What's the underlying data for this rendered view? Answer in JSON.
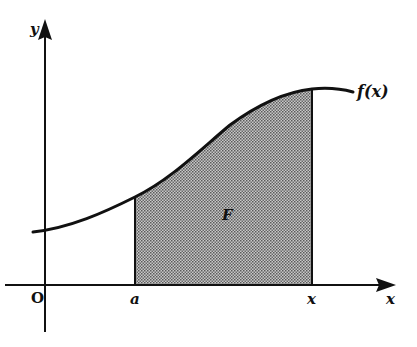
{
  "diagram": {
    "labels": {
      "y_axis": "y",
      "x_axis": "x",
      "origin": "O",
      "lower_bound": "a",
      "upper_bound": "x",
      "function": "f(x)",
      "area": "F"
    },
    "colors": {
      "line": "#111111",
      "fill": "#9a9a9a",
      "background": "#ffffff"
    },
    "elements": [
      {
        "type": "axis",
        "name": "x-axis",
        "direction": "horizontal"
      },
      {
        "type": "axis",
        "name": "y-axis",
        "direction": "vertical"
      },
      {
        "type": "curve",
        "name": "f(x)",
        "shape": "increasing sigmoid-like curve"
      },
      {
        "type": "shaded-region",
        "name": "F",
        "from": "a",
        "to": "x"
      }
    ]
  }
}
